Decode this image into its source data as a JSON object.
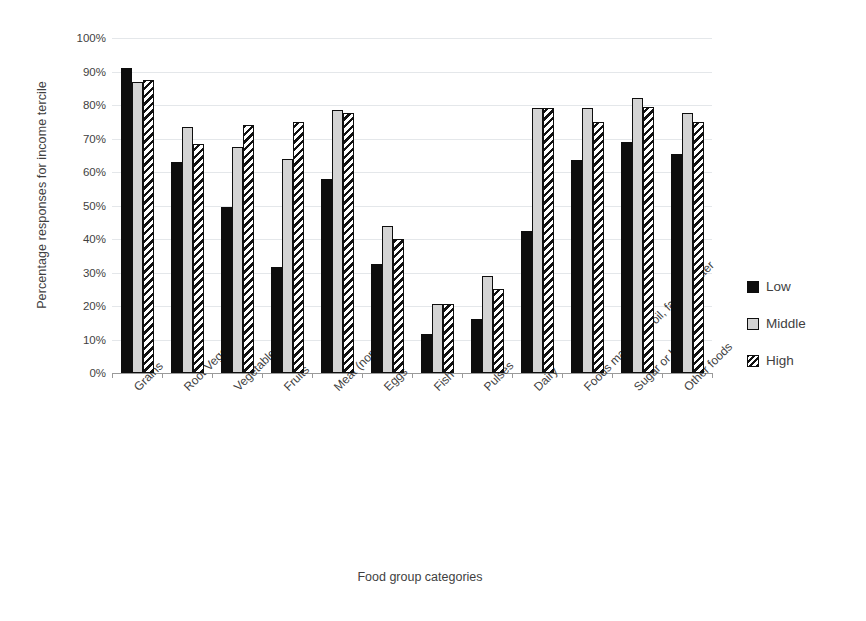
{
  "chart_data": {
    "type": "bar",
    "title": "",
    "xlabel": "Food group categories",
    "ylabel": "Percentage responses for income tercile",
    "ylim": [
      0,
      100
    ],
    "y_tick_labels": [
      "100%",
      "90%",
      "80%",
      "70%",
      "60%",
      "50%",
      "40%",
      "30%",
      "20%",
      "10%",
      "0%"
    ],
    "y_tick_values": [
      100,
      90,
      80,
      70,
      60,
      50,
      40,
      30,
      20,
      10,
      0
    ],
    "grid": true,
    "legend_position": "right",
    "categories": [
      "Grains",
      "Root Vegetables",
      "Vegetables",
      "Fruits",
      "Meat (non Fish)",
      "Eggs",
      "Fish",
      "Pulses",
      "Dairy",
      "Foods made with oil, fat, or butter",
      "Sugar or honey",
      "Other foods"
    ],
    "series": [
      {
        "name": "Low",
        "pattern": "solid-black",
        "color": "#0d0d0d",
        "values": [
          91,
          63,
          49.5,
          31.5,
          58,
          32.5,
          11.5,
          16,
          42.5,
          63.5,
          69,
          65.5
        ]
      },
      {
        "name": "Middle",
        "pattern": "solid-gray",
        "color": "#d4d4d4",
        "values": [
          87,
          73.5,
          67.5,
          64,
          78.5,
          44,
          20.5,
          29,
          79,
          79,
          82,
          77.5
        ]
      },
      {
        "name": "High",
        "pattern": "diagonal-hatch",
        "color": "#ffffff",
        "values": [
          87.5,
          68.5,
          74,
          75,
          77.5,
          40,
          20.5,
          25,
          79,
          75,
          79.5,
          75
        ]
      }
    ]
  },
  "legend": {
    "items": [
      {
        "label": "Low"
      },
      {
        "label": "Middle"
      },
      {
        "label": "High"
      }
    ]
  }
}
